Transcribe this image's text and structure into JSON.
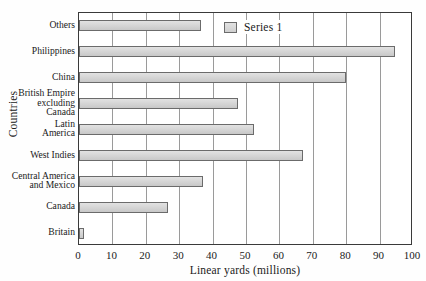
{
  "chart_data": {
    "type": "bar",
    "orientation": "horizontal",
    "title": "",
    "xlabel": "Linear yards (millions)",
    "ylabel": "Countries",
    "xlim": [
      0,
      100
    ],
    "xticks": [
      0,
      10,
      20,
      30,
      40,
      50,
      60,
      70,
      80,
      90,
      100
    ],
    "grid": "vertical",
    "legend_position": "top-center",
    "legend": [
      "Series 1"
    ],
    "categories": [
      "Others",
      "Philippines",
      "China",
      "British Empire\nexcluding\nCanada",
      "Latin\nAmerica",
      "West Indies",
      "Central America\nand Mexico",
      "Canada",
      "Britain"
    ],
    "series": [
      {
        "name": "Series 1",
        "color": "#d4d4d4",
        "values": [
          36.5,
          94.5,
          80,
          47.5,
          52.5,
          67,
          37,
          26.5,
          1.5
        ]
      }
    ]
  }
}
